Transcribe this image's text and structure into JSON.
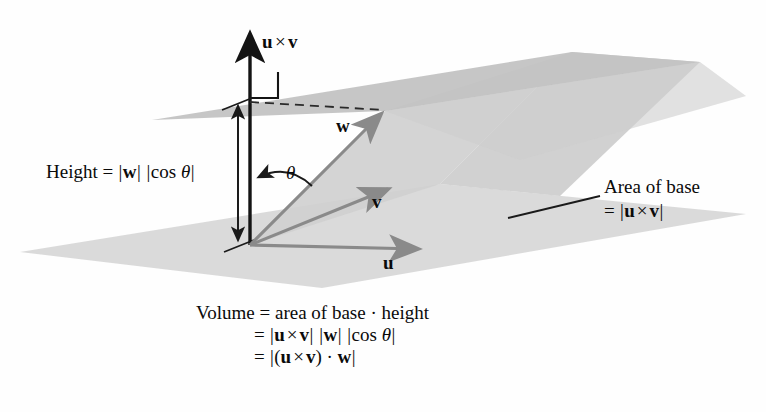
{
  "figure": {
    "type": "vector-diagram",
    "topic": "scalar triple product / volume of a parallelepiped",
    "labels": {
      "cross_vector": "u × v",
      "vector_w": "w",
      "vector_v": "v",
      "vector_u": "u",
      "angle": "θ",
      "height_line": "Height = |w| |cos θ|",
      "area_line1": "Area of base",
      "area_line2": "= |u × v|"
    },
    "formula": {
      "line1": "Volume = area of base · height",
      "line2": "= |u × v| |w| |cos θ|",
      "line3": "= |(u × v) · w|"
    },
    "colors": {
      "background": "#fefefe",
      "base_plane": "#d8d8d8",
      "top_plane": "#c2c2c2",
      "side_plane": "#cccccc",
      "vector_gray": "#8a8a8a",
      "axis_black": "#111111",
      "text": "#0a0a0a"
    },
    "geometry": {
      "origin": [
        250,
        245
      ],
      "cross_arrow_tip": [
        250,
        30
      ],
      "w_tip": [
        385,
        110
      ],
      "v_tip": [
        392,
        186
      ],
      "u_tip": [
        422,
        250
      ],
      "dashed_line": [
        [
          250,
          102
        ],
        [
          385,
          110
        ]
      ],
      "right_angle_marker": [
        [
          250,
          98
        ],
        [
          278,
          98
        ],
        [
          278,
          72
        ]
      ],
      "height_arrow": [
        [
          238,
          243
        ],
        [
          238,
          104
        ]
      ],
      "base_plane_points": [
        [
          20,
          252
        ],
        [
          440,
          184
        ],
        [
          746,
          214
        ],
        [
          322,
          288
        ]
      ],
      "top_plane_points": [
        [
          152,
          120
        ],
        [
          572,
          52
        ],
        [
          700,
          62
        ],
        [
          385,
          111
        ]
      ],
      "area_leader_line": [
        [
          508,
          218
        ],
        [
          600,
          196
        ]
      ]
    }
  }
}
